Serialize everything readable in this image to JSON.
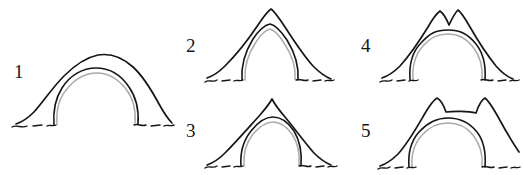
{
  "document": {
    "kind": "line-drawing-diagram",
    "subject": "numbered arch and vault profile silhouettes",
    "style": "hand-drawn ink sketch",
    "background_color": "#ffffff",
    "ink_color": "#16161a",
    "shadow_ink_color": "#8e8e96",
    "figure_count": 5
  },
  "figures": [
    {
      "id": "figure-1",
      "label": "1",
      "description": "wide low semicircular arch with smooth rounded crown",
      "crown_shape": "single rounded crown",
      "opening_shape": "semicircular",
      "label_x": 14,
      "label_y": 78
    },
    {
      "id": "figure-2",
      "label": "2",
      "description": "tall pointed arch with sharp apex and pointed opening",
      "crown_shape": "single sharp peak",
      "opening_shape": "pointed",
      "label_x": 186,
      "label_y": 52
    },
    {
      "id": "figure-3",
      "label": "3",
      "description": "pointed outer profile with rounded horseshoe opening",
      "crown_shape": "single narrow peak",
      "opening_shape": "rounded",
      "label_x": 186,
      "label_y": 137
    },
    {
      "id": "figure-4",
      "label": "4",
      "description": "twin-peaked crown with notch between peaks over rounded opening",
      "crown_shape": "double peak with central notch",
      "opening_shape": "rounded",
      "label_x": 361,
      "label_y": 52
    },
    {
      "id": "figure-5",
      "label": "5",
      "description": "two shoulder horns with dipped saddle crown over rounded opening",
      "crown_shape": "saddle between two horns",
      "opening_shape": "rounded",
      "label_x": 361,
      "label_y": 137
    }
  ]
}
